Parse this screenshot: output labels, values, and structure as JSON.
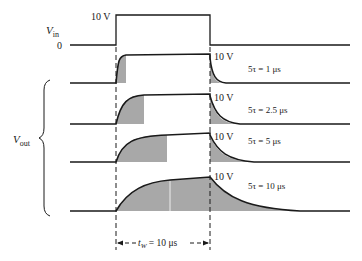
{
  "figure": {
    "input": {
      "label_main": "V",
      "label_sub": "in",
      "zero_label": "0",
      "high_label": "10 V"
    },
    "output": {
      "label_main": "V",
      "label_sub": "out"
    },
    "waveforms": [
      {
        "amplitude_label": "10 V",
        "tau_label": "5τ = 1 μs",
        "five_tau_us": 1
      },
      {
        "amplitude_label": "10 V",
        "tau_label": "5τ = 2.5 μs",
        "five_tau_us": 2.5
      },
      {
        "amplitude_label": "10 V",
        "tau_label": "5τ = 5 μs",
        "five_tau_us": 5
      },
      {
        "amplitude_label": "10 V",
        "tau_label": "5τ = 10 μs",
        "five_tau_us": 10
      }
    ],
    "pulse_width": {
      "symbol": "t",
      "symbol_sub": "W",
      "value_label": " = 10 μs",
      "pulse_width_us": 10
    },
    "colors": {
      "line": "#1a1a1a",
      "shade": "#a8a8a8",
      "background": "#ffffff"
    }
  }
}
